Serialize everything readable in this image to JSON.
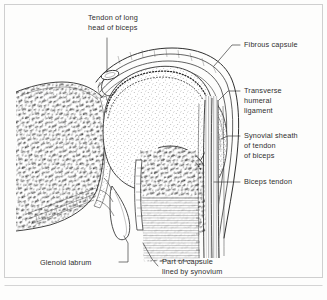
{
  "figure": {
    "style": "pen-and-ink anatomical line drawing",
    "border_color": "#cfcfcf",
    "ink_color": "#2a2a2a",
    "paper_color": "#fdfdfc"
  },
  "labels": {
    "tendon_long_head": {
      "line1": "Tendon of long",
      "line2": "head of biceps"
    },
    "fibrous_capsule": {
      "line1": "Fibrous capsule"
    },
    "transverse_humeral_ligament": {
      "line1": "Transverse",
      "line2": "humeral",
      "line3": "ligament"
    },
    "synovial_sheath": {
      "line1": "Synovial sheath",
      "line2": "of tendon",
      "line3": "of biceps"
    },
    "biceps_tendon": {
      "line1": "Biceps tendon"
    },
    "glenoid_labrum": {
      "line1": "Glenoid labrum"
    },
    "part_of_capsule": {
      "line1": "Part of capsule",
      "line2": "lined by synovium"
    }
  }
}
